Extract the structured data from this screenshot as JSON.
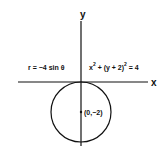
{
  "diagram": {
    "axis_x_label": "x",
    "axis_y_label": "y",
    "polar_equation": "r = −4 sin θ",
    "cartesian_equation": {
      "prefix": "x",
      "exp1": "2",
      "middle": " + (y + 2)",
      "exp2": "2",
      "suffix": " = 4"
    },
    "center_label": "(0,−2)",
    "circle": {
      "center": [
        0,
        -2
      ],
      "radius": 2
    },
    "colors": {
      "ink": "#111111",
      "background": "#ffffff"
    }
  }
}
